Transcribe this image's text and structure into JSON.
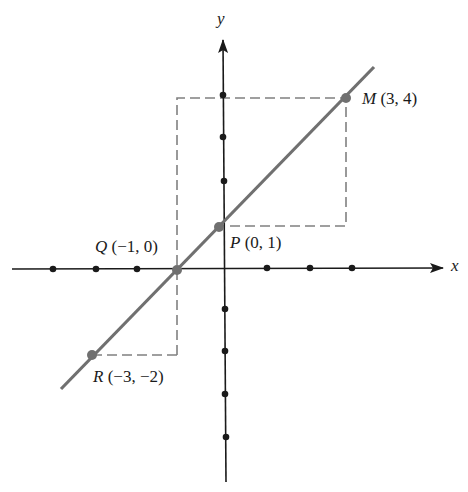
{
  "figure": {
    "axes": {
      "x_label": "x",
      "y_label": "y",
      "x_ticks_visible": [
        -4,
        -3,
        -2,
        -1,
        1,
        2,
        3
      ],
      "y_ticks_visible": [
        -5,
        -4,
        -3,
        -2,
        2,
        3,
        4
      ],
      "axis_color": "#1a1a1a"
    },
    "line": {
      "description": "Line through R, Q, P, M with slope 1",
      "equation": "y = x + 1",
      "color": "#707070"
    },
    "dashed_guides_color": "#808080",
    "points": [
      {
        "id": "M",
        "name": "M",
        "coords": "(3, 4)",
        "x": 3,
        "y": 4
      },
      {
        "id": "P",
        "name": "P",
        "coords": "(0, 1)",
        "x": 0,
        "y": 1
      },
      {
        "id": "Q",
        "name": "Q",
        "coords": "(−1, 0)",
        "x": -1,
        "y": 0
      },
      {
        "id": "R",
        "name": "R",
        "coords": "(−3, −2)",
        "x": -3,
        "y": -2
      }
    ]
  }
}
